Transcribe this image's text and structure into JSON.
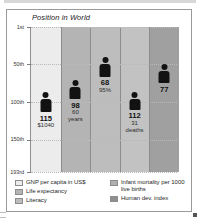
{
  "chart_data": {
    "type": "bar",
    "title": "Position in World",
    "xlabel": "",
    "ylabel": "",
    "grid": true,
    "legend_position": "bottom",
    "axis_note": "Rank axis, inverted: 1st at top, 193rd at bottom",
    "ytick_labels": [
      "1st",
      "50th",
      "100th",
      "150th",
      "193rd"
    ],
    "ytick_values": [
      1,
      50,
      100,
      150,
      193
    ],
    "ylim": [
      1,
      193
    ],
    "categories": [
      "GNP per capita in US$",
      "Life expectancy",
      "Literacy",
      "Infant mortality per 1000 live births",
      "Human dev. index"
    ],
    "values": [
      115,
      98,
      68,
      112,
      77
    ],
    "value_labels": [
      "115",
      "98",
      "68",
      "112",
      "77"
    ],
    "sub_labels": [
      "$1040",
      "60 years",
      "95%",
      "31 deaths",
      ""
    ],
    "sub_labels_lines": [
      [
        "$1040"
      ],
      [
        "60",
        "years"
      ],
      [
        "95%"
      ],
      [
        "31",
        "deaths"
      ],
      []
    ],
    "column_colors": [
      "#ececec",
      "#b4b4b4",
      "#bdbdbd",
      "#c2c2c2",
      "#a0a0a0"
    ],
    "marker": "person-pictogram",
    "marker_color": "#121212"
  },
  "legend": {
    "left": [
      {
        "label": "GNP per capita in US$",
        "color": "#ececec"
      },
      {
        "label": "Life expectancy",
        "color": "#b4b4b4"
      },
      {
        "label": "Literacy",
        "color": "#bdbdbd"
      }
    ],
    "right": [
      {
        "label": "Infant mortality per 1000 live births",
        "color": "#b0b0b0"
      },
      {
        "label": "Human dev. index",
        "color": "#8f8f8f"
      }
    ]
  }
}
